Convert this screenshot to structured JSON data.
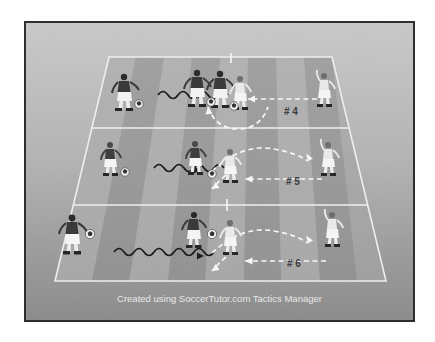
{
  "figure": {
    "caption": "Created using SoccerTutor.com Tactics Manager",
    "frame_border_color": "#2e2e2e",
    "pitch_base_color": "#9d9d9d",
    "pitch_stripe_light": "#b3b3b3",
    "pitch_stripe_dark": "#8e8e8e",
    "line_color": "#f2f2f2"
  },
  "zones": [
    {
      "label": "# 4",
      "label_x": 291,
      "label_y": 118
    },
    {
      "label": "# 5",
      "label_y": 183,
      "label_x": 293
    },
    {
      "label": "# 6",
      "label_x": 294,
      "label_y": 265
    }
  ],
  "legend": {
    "dribble_run": "dribble with ball (wavy arrow)",
    "pass": "pass (white dashed arrow)",
    "movement": "player movement (white dashed curve)"
  },
  "players": [
    {
      "id": "p1-left",
      "zone": "# 4",
      "kit": "dark",
      "has_ball": true,
      "x": 121,
      "y": 80
    },
    {
      "id": "p1-mid-a",
      "zone": "# 4",
      "kit": "dark",
      "has_ball": true,
      "x": 196,
      "y": 76
    },
    {
      "id": "p1-mid-b",
      "zone": "# 4",
      "kit": "dark",
      "has_ball": true,
      "x": 219,
      "y": 77
    },
    {
      "id": "p1-mid-c",
      "zone": "# 4",
      "kit": "light",
      "has_ball": false,
      "x": 239,
      "y": 82
    },
    {
      "id": "p1-right",
      "zone": "# 4",
      "kit": "light",
      "has_ball": false,
      "x": 322,
      "y": 80
    },
    {
      "id": "p2-left",
      "zone": "# 5",
      "kit": "light",
      "has_ball": true,
      "x": 108,
      "y": 150
    },
    {
      "id": "p2-mid-a",
      "zone": "# 5",
      "kit": "light",
      "has_ball": true,
      "x": 193,
      "y": 149
    },
    {
      "id": "p2-mid-b",
      "zone": "# 5",
      "kit": "light",
      "has_ball": false,
      "x": 228,
      "y": 157
    },
    {
      "id": "p2-right",
      "zone": "# 5",
      "kit": "light",
      "has_ball": false,
      "x": 326,
      "y": 150
    },
    {
      "id": "p3-left",
      "zone": "# 6",
      "kit": "dark",
      "has_ball": true,
      "x": 74,
      "y": 234
    },
    {
      "id": "p3-mid-a",
      "zone": "# 6",
      "kit": "dark",
      "has_ball": true,
      "x": 192,
      "y": 231
    },
    {
      "id": "p3-mid-b",
      "zone": "# 6",
      "kit": "light",
      "has_ball": false,
      "x": 228,
      "y": 239
    },
    {
      "id": "p3-right",
      "zone": "# 6",
      "kit": "light",
      "has_ball": false,
      "x": 330,
      "y": 232
    }
  ],
  "balls": [
    {
      "id": "ball-1-left",
      "x": 137,
      "y": 91
    },
    {
      "id": "ball-1-a",
      "x": 209,
      "y": 89
    },
    {
      "id": "ball-1-b",
      "x": 232,
      "y": 93
    },
    {
      "id": "ball-2-left",
      "x": 124,
      "y": 160
    },
    {
      "id": "ball-2-mid",
      "x": 210,
      "y": 162
    },
    {
      "id": "ball-3-left",
      "x": 91,
      "y": 245
    },
    {
      "id": "ball-3-mid",
      "x": 210,
      "y": 244
    }
  ]
}
